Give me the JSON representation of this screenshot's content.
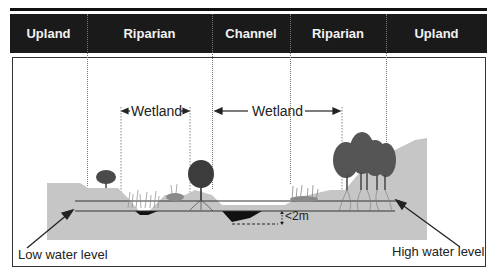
{
  "header": {
    "zones": [
      {
        "label": "Upland"
      },
      {
        "label": "Riparian"
      },
      {
        "label": "Channel"
      },
      {
        "label": "Riparian"
      },
      {
        "label": "Upland"
      }
    ]
  },
  "annotations": {
    "wetland_left": "Wetland",
    "wetland_right": "Wetland",
    "depth": "<2m",
    "low_water": "Low water level",
    "high_water": "High water level"
  },
  "colors": {
    "header_bg": "#1a1a1a",
    "header_text": "#f2f2f2",
    "ground": "#c8c8c8",
    "water": "#111111",
    "vegetation": "#555555"
  }
}
